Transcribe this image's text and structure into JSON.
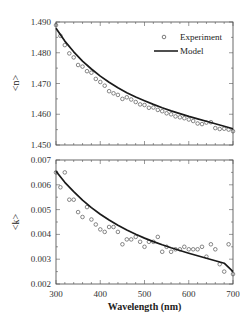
{
  "chart_data": [
    {
      "type": "scatter",
      "title": "",
      "xlabel": "Wavelength (nm)",
      "ylabel": "<n>",
      "xlim": [
        300,
        700
      ],
      "ylim": [
        1.45,
        1.49
      ],
      "yticks": [
        "1.490",
        "1.480",
        "1.470",
        "1.460",
        "1.450"
      ],
      "legend": {
        "position": "upper right",
        "entries": [
          "Experiment",
          "Model"
        ]
      },
      "series": [
        {
          "name": "Experiment",
          "style": "open-circle",
          "x": [
            300,
            310,
            320,
            330,
            340,
            350,
            360,
            370,
            380,
            390,
            400,
            410,
            420,
            430,
            440,
            450,
            460,
            470,
            480,
            490,
            500,
            510,
            520,
            530,
            540,
            550,
            560,
            570,
            580,
            590,
            600,
            610,
            620,
            630,
            640,
            650,
            660,
            670,
            680,
            690,
            700
          ],
          "values": [
            1.489,
            1.4855,
            1.4825,
            1.4798,
            1.4785,
            1.476,
            1.4755,
            1.474,
            1.4735,
            1.4715,
            1.4705,
            1.4693,
            1.4675,
            1.4668,
            1.4663,
            1.465,
            1.4655,
            1.4648,
            1.464,
            1.4632,
            1.463,
            1.4621,
            1.4622,
            1.4614,
            1.461,
            1.4603,
            1.46,
            1.4593,
            1.459,
            1.4587,
            1.4583,
            1.4578,
            1.457,
            1.4568,
            1.4573,
            1.4574,
            1.4555,
            1.4552,
            1.4553,
            1.455,
            1.4545
          ]
        },
        {
          "name": "Model",
          "style": "solid-line",
          "x": [
            300,
            320,
            340,
            360,
            380,
            400,
            420,
            440,
            460,
            480,
            500,
            520,
            540,
            560,
            580,
            600,
            620,
            640,
            660,
            680,
            700
          ],
          "values": [
            1.488,
            1.4838,
            1.4803,
            1.4773,
            1.4747,
            1.4724,
            1.4704,
            1.4686,
            1.467,
            1.4656,
            1.4644,
            1.4632,
            1.4621,
            1.4611,
            1.4602,
            1.4593,
            1.4585,
            1.4577,
            1.4569,
            1.4561,
            1.4553
          ]
        }
      ]
    },
    {
      "type": "scatter",
      "title": "",
      "xlabel": "Wavelength (nm)",
      "ylabel": "<k>",
      "xlim": [
        300,
        700
      ],
      "ylim": [
        0.002,
        0.007
      ],
      "xticks": [
        "300",
        "400",
        "500",
        "600",
        "700"
      ],
      "yticks": [
        "0.007",
        "0.006",
        "0.005",
        "0.004",
        "0.003",
        "0.002"
      ],
      "series": [
        {
          "name": "Experiment",
          "style": "open-circle",
          "x": [
            300,
            310,
            320,
            330,
            340,
            350,
            360,
            370,
            380,
            390,
            400,
            410,
            420,
            430,
            440,
            450,
            460,
            470,
            480,
            490,
            500,
            510,
            520,
            530,
            540,
            550,
            560,
            570,
            580,
            590,
            600,
            610,
            620,
            630,
            640,
            650,
            660,
            670,
            680,
            690,
            700
          ],
          "values": [
            0.0065,
            0.0059,
            0.0065,
            0.0054,
            0.0054,
            0.0049,
            0.0047,
            0.0051,
            0.0046,
            0.0044,
            0.0042,
            0.0041,
            0.0043,
            0.0043,
            0.0041,
            0.0036,
            0.0038,
            0.0038,
            0.0039,
            0.0037,
            0.0035,
            0.0037,
            0.0037,
            0.0039,
            0.0033,
            0.0035,
            0.0033,
            0.0034,
            0.0034,
            0.0035,
            0.0034,
            0.0034,
            0.0034,
            0.0035,
            0.0031,
            0.0036,
            0.0034,
            0.0028,
            0.0025,
            0.0036,
            0.0024
          ]
        },
        {
          "name": "Model",
          "style": "solid-line",
          "x": [
            300,
            320,
            340,
            360,
            380,
            400,
            420,
            440,
            460,
            480,
            500,
            520,
            540,
            560,
            580,
            600,
            620,
            640,
            660,
            680,
            700
          ],
          "values": [
            0.00655,
            0.0061,
            0.00572,
            0.00538,
            0.00508,
            0.00481,
            0.00458,
            0.00437,
            0.00418,
            0.00401,
            0.00385,
            0.00371,
            0.00358,
            0.00346,
            0.00335,
            0.00324,
            0.00314,
            0.00304,
            0.00294,
            0.00284,
            0.0025
          ]
        }
      ]
    }
  ],
  "labels": {
    "xlabel": "Wavelength (nm)",
    "top_ylabel": "<n>",
    "bottom_ylabel": "<k>",
    "legend_experiment": "Experiment",
    "legend_model": "Model"
  },
  "ticks": {
    "top_y": [
      "1.490",
      "1.480",
      "1.470",
      "1.460",
      "1.450"
    ],
    "bottom_y": [
      "0.007",
      "0.006",
      "0.005",
      "0.004",
      "0.003",
      "0.002"
    ],
    "x": [
      "300",
      "400",
      "500",
      "600",
      "700"
    ]
  }
}
